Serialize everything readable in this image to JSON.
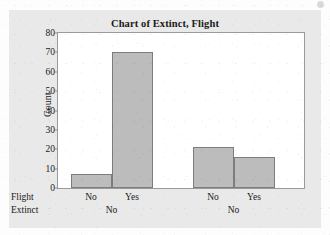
{
  "chart_data": {
    "type": "bar",
    "title": "Chart of Extinct, Flight",
    "xlabel": "",
    "ylabel": "Count",
    "ylim": [
      0,
      80
    ],
    "yticks": [
      0,
      10,
      20,
      30,
      40,
      50,
      60,
      70,
      80
    ],
    "grid": false,
    "legend": null,
    "axis_level_names": [
      "Flight",
      "Extinct"
    ],
    "categories": [
      "No",
      "Yes",
      "No",
      "Yes"
    ],
    "values": [
      7,
      70,
      21,
      16
    ],
    "groups": [
      {
        "label": "No",
        "categories": [
          "No",
          "Yes"
        ],
        "values": [
          7,
          70
        ]
      },
      {
        "label": "No",
        "categories": [
          "No",
          "Yes"
        ],
        "values": [
          21,
          16
        ]
      }
    ],
    "bar_color": "#bcbcbc",
    "bar_edge_color": "#7d7d7d",
    "panel_color": "#e9e9e9",
    "plot_color": "#ffffff"
  },
  "axis": {
    "y_title": "Count",
    "ticks": [
      {
        "value": "80"
      },
      {
        "value": "70"
      },
      {
        "value": "60"
      },
      {
        "value": "50"
      },
      {
        "value": "40"
      },
      {
        "value": "30"
      },
      {
        "value": "20"
      },
      {
        "value": "10"
      },
      {
        "value": "0"
      }
    ],
    "row_names": [
      {
        "label": "Flight"
      },
      {
        "label": "Extinct"
      }
    ],
    "tick_labels": [
      {
        "label": "No"
      },
      {
        "label": "Yes"
      },
      {
        "label": "No"
      },
      {
        "label": "Yes"
      }
    ],
    "group_labels": [
      {
        "label": "No"
      },
      {
        "label": "No"
      }
    ]
  }
}
